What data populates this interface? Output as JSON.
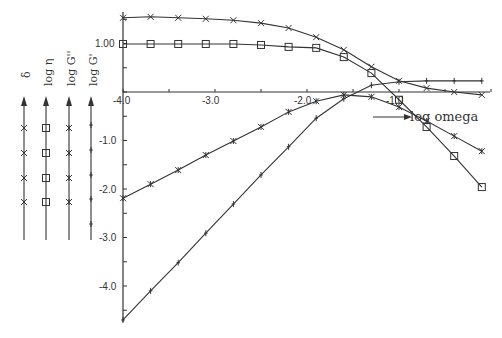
{
  "chart_data": {
    "type": "line",
    "title": "",
    "xlabel": "log omega",
    "ylabel": "",
    "xlim": [
      -4.0,
      0.0
    ],
    "ylim": [
      -4.8,
      1.6
    ],
    "grid": false,
    "x_tick_labels": [
      "-4.0",
      "-3.0",
      "-2.0",
      "-1.0"
    ],
    "y_tick_labels": [
      "1.00",
      "-1.0",
      "-2.0",
      "-3.0",
      "-4.0"
    ],
    "legend_position": "left, vertical arrows",
    "legend": [
      {
        "label": "δ",
        "marker": "x"
      },
      {
        "label": "log η",
        "marker": "square"
      },
      {
        "label": "log G''",
        "marker": "asterisk"
      },
      {
        "label": "log G'",
        "marker": "plus"
      }
    ],
    "series": [
      {
        "name": "δ",
        "marker": "x",
        "x": [
          -4.0,
          -3.7,
          -3.4,
          -3.1,
          -2.8,
          -2.5,
          -2.2,
          -1.9,
          -1.6,
          -1.3,
          -1.0,
          -0.7,
          -0.4,
          -0.1
        ],
        "values": [
          1.53,
          1.55,
          1.53,
          1.51,
          1.48,
          1.42,
          1.32,
          1.13,
          0.87,
          0.52,
          0.23,
          0.08,
          0.0,
          -0.06
        ]
      },
      {
        "name": "log η",
        "marker": "square",
        "x": [
          -4.0,
          -3.7,
          -3.4,
          -3.1,
          -2.8,
          -2.5,
          -2.2,
          -1.9,
          -1.6,
          -1.3,
          -1.0,
          -0.7,
          -0.4,
          -0.1
        ],
        "values": [
          0.99,
          0.99,
          0.99,
          0.99,
          0.99,
          0.97,
          0.93,
          0.91,
          0.72,
          0.39,
          -0.16,
          -0.72,
          -1.32,
          -1.96
        ]
      },
      {
        "name": "log G''",
        "marker": "asterisk",
        "x": [
          -4.0,
          -3.7,
          -3.4,
          -3.1,
          -2.8,
          -2.5,
          -2.2,
          -1.9,
          -1.6,
          -1.3,
          -1.0,
          -0.7,
          -0.4,
          -0.1
        ],
        "values": [
          -2.19,
          -1.9,
          -1.61,
          -1.3,
          -1.01,
          -0.72,
          -0.41,
          -0.19,
          -0.06,
          -0.1,
          -0.31,
          -0.6,
          -0.91,
          -1.22
        ]
      },
      {
        "name": "log G'",
        "marker": "plus",
        "x": [
          -4.0,
          -3.7,
          -3.4,
          -3.1,
          -2.8,
          -2.5,
          -2.2,
          -1.9,
          -1.6,
          -1.3,
          -1.0,
          -0.7,
          -0.4,
          -0.1
        ],
        "values": [
          -4.7,
          -4.1,
          -3.52,
          -2.91,
          -2.31,
          -1.71,
          -1.13,
          -0.54,
          -0.14,
          0.14,
          0.21,
          0.23,
          0.23,
          0.23
        ]
      }
    ]
  },
  "labels": {
    "x_axis_label": "log omega",
    "y_tick_100": "1.00",
    "x_tick_m4": "-4.0",
    "x_tick_m3": "-3.0",
    "x_tick_m2": "-2.0",
    "x_tick_m1": "-1.0",
    "y_tick_m1": "-1.0",
    "y_tick_m2": "-2.0",
    "y_tick_m3": "-3.0",
    "y_tick_m4": "-4.0",
    "legend_delta": "δ",
    "legend_eta": "log η",
    "legend_gpp": "log G''",
    "legend_gp": "log G'"
  }
}
